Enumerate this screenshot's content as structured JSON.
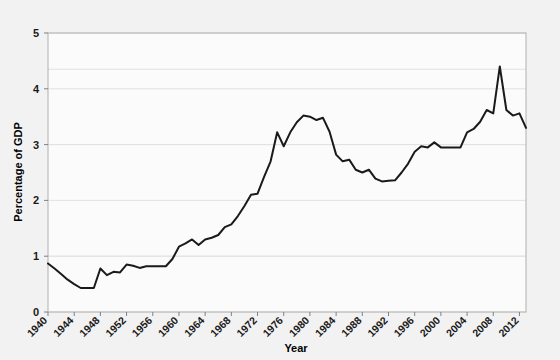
{
  "chart_data": {
    "type": "line",
    "title": "",
    "xlabel": "Year",
    "ylabel": "Percentage of GDP",
    "xlim": [
      1940,
      2013
    ],
    "ylim": [
      0,
      5
    ],
    "grid": true,
    "legend": "none",
    "line_color": "#1a1a1a",
    "background_color": "#f2f2f2",
    "plot_background_color": "#fbfbfb",
    "frame_color": "#b0b0b0",
    "gridline_color": "#e2e2e2",
    "y_ticks": [
      "0",
      "1",
      "2",
      "3",
      "4",
      "5"
    ],
    "x_ticks": [
      "1940",
      "1944",
      "1948",
      "1952",
      "1956",
      "1960",
      "1964",
      "1968",
      "1972",
      "1976",
      "1980",
      "1984",
      "1988",
      "1992",
      "1996",
      "2000",
      "2004",
      "2008",
      "2012"
    ],
    "x": [
      1940,
      1941,
      1942,
      1943,
      1944,
      1945,
      1946,
      1947,
      1948,
      1949,
      1950,
      1951,
      1952,
      1953,
      1954,
      1955,
      1956,
      1957,
      1958,
      1959,
      1960,
      1961,
      1962,
      1963,
      1964,
      1965,
      1966,
      1967,
      1968,
      1969,
      1970,
      1971,
      1972,
      1973,
      1974,
      1975,
      1976,
      1977,
      1978,
      1979,
      1980,
      1981,
      1982,
      1983,
      1984,
      1985,
      1986,
      1987,
      1988,
      1989,
      1990,
      1991,
      1992,
      1993,
      1994,
      1995,
      1996,
      1997,
      1998,
      1999,
      2000,
      2001,
      2002,
      2003,
      2004,
      2005,
      2006,
      2007,
      2008,
      2009,
      2010,
      2011,
      2012,
      2013
    ],
    "values": [
      0.87,
      0.78,
      0.68,
      0.58,
      0.5,
      0.43,
      0.43,
      0.43,
      0.78,
      0.66,
      0.72,
      0.71,
      0.85,
      0.83,
      0.79,
      0.82,
      0.82,
      0.82,
      0.82,
      0.95,
      1.17,
      1.23,
      1.3,
      1.2,
      1.3,
      1.33,
      1.38,
      1.52,
      1.57,
      1.72,
      1.9,
      2.1,
      2.12,
      2.42,
      2.7,
      3.22,
      2.97,
      3.22,
      3.4,
      3.52,
      3.5,
      3.44,
      3.48,
      3.23,
      2.82,
      2.7,
      2.73,
      2.55,
      2.5,
      2.55,
      2.39,
      2.34,
      2.35,
      2.36,
      2.5,
      2.66,
      2.87,
      2.97,
      2.95,
      3.04,
      2.95,
      2.95,
      2.95,
      2.95,
      3.22,
      3.28,
      3.41,
      3.62,
      3.56,
      3.46,
      3.43,
      3.4,
      3.24,
      3.3
    ],
    "spike_year": 2009,
    "spike_value": 4.4,
    "post_spike": [
      3.62,
      3.52,
      3.56
    ]
  }
}
